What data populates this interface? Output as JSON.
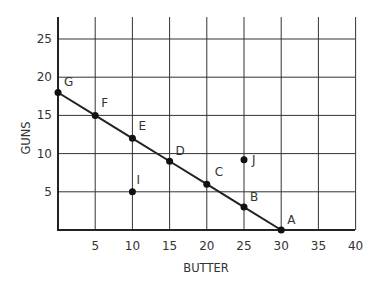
{
  "chart_data": {
    "type": "line",
    "title": "",
    "xlabel": "BUTTER",
    "ylabel": "GUNS",
    "xlim": [
      0,
      40
    ],
    "ylim": [
      0,
      27.5
    ],
    "grid": true,
    "x_ticks": [
      5,
      10,
      15,
      20,
      25,
      30,
      35,
      40
    ],
    "y_ticks": [
      5,
      10,
      15,
      20,
      25
    ],
    "series": [
      {
        "name": "Production Possibilities Frontier",
        "points": [
          {
            "label": "G",
            "x": 0,
            "y": 18
          },
          {
            "label": "F",
            "x": 5,
            "y": 15
          },
          {
            "label": "E",
            "x": 10,
            "y": 12
          },
          {
            "label": "D",
            "x": 15,
            "y": 9
          },
          {
            "label": "C",
            "x": 20,
            "y": 6
          },
          {
            "label": "B",
            "x": 25,
            "y": 3
          },
          {
            "label": "A",
            "x": 30,
            "y": 0
          }
        ]
      }
    ],
    "extra_points": [
      {
        "label": "I",
        "x": 10,
        "y": 5
      },
      {
        "label": "J",
        "x": 25,
        "y": 9.2
      }
    ],
    "legend": "none"
  },
  "axes": {
    "x_label": "BUTTER",
    "y_label": "GUNS"
  }
}
